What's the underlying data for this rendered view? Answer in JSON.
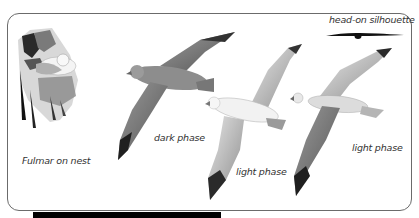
{
  "plate": {
    "subject": "Fulmar identification plate",
    "labels": {
      "head_on": "head-on silhouette",
      "nest": "Fulmar on nest",
      "dark_phase": "dark phase",
      "light_phase_center": "light phase",
      "light_phase_right": "light phase"
    },
    "illustrations": [
      {
        "name": "fulmar-on-nest",
        "caption": "Fulmar on nest"
      },
      {
        "name": "fulmar-dark-phase",
        "caption": "dark phase"
      },
      {
        "name": "fulmar-light-phase-center",
        "caption": "light phase"
      },
      {
        "name": "fulmar-light-phase-right",
        "caption": "light phase"
      },
      {
        "name": "head-on-silhouette",
        "caption": "head-on silhouette"
      }
    ],
    "colors": {
      "frame_border": "#6b6b6b",
      "background": "#ffffff",
      "text": "#333333",
      "bar": "#000000"
    }
  }
}
